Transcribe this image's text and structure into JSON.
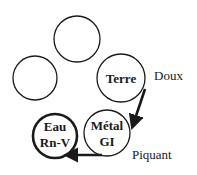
{
  "diagram": {
    "nodes": [
      {
        "id": "top",
        "label_lines": [],
        "cx": 77,
        "cy": 39,
        "r": 23,
        "stroke_width": 1.3
      },
      {
        "id": "left",
        "label_lines": [],
        "cx": 35,
        "cy": 78,
        "r": 22,
        "stroke_width": 1.3
      },
      {
        "id": "terre",
        "label_lines": [
          "Terre"
        ],
        "cx": 121,
        "cy": 78,
        "r": 24,
        "stroke_width": 1.3
      },
      {
        "id": "metal",
        "label_lines": [
          "Métal",
          "GI"
        ],
        "cx": 107,
        "cy": 133,
        "r": 23,
        "stroke_width": 1.3
      },
      {
        "id": "eau",
        "label_lines": [
          "Eau",
          "Rn-V"
        ],
        "cx": 55,
        "cy": 136,
        "r": 22,
        "stroke_width": 2.6
      }
    ],
    "edges": [
      {
        "from": "terre",
        "to": "metal"
      },
      {
        "from": "metal",
        "to": "eau"
      }
    ],
    "annotations": {
      "doux": "Doux",
      "piquant": "Piquant"
    },
    "colors": {
      "stroke": "#1a1a1a",
      "background": "#ffffff"
    }
  },
  "labels": {
    "terre": "Terre",
    "metal_1": "Métal",
    "metal_2": "GI",
    "eau_1": "Eau",
    "eau_2": "Rn-V",
    "doux": "Doux",
    "piquant": "Piquant"
  }
}
